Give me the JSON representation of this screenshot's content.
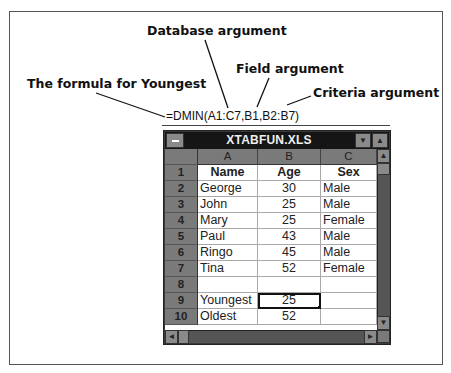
{
  "callouts": {
    "database": "Database argument",
    "field": "Field argument",
    "youngest": "The formula for Youngest",
    "criteria": "Criteria argument"
  },
  "formula": "=DMIN(A1:C7,B1,B2:B7)",
  "window": {
    "title": "XTABFUN.XLS",
    "system_menu_icon": "minus-icon",
    "minimize_icon": "down-triangle-icon",
    "maximize_icon": "up-triangle-icon"
  },
  "columns": [
    "A",
    "B",
    "C"
  ],
  "rows": [
    {
      "num": "1",
      "a": "Name",
      "b": "Age",
      "c": "Sex",
      "header": true
    },
    {
      "num": "2",
      "a": "George",
      "b": "30",
      "c": "Male"
    },
    {
      "num": "3",
      "a": "John",
      "b": "25",
      "c": "Male"
    },
    {
      "num": "4",
      "a": "Mary",
      "b": "25",
      "c": "Female"
    },
    {
      "num": "5",
      "a": "Paul",
      "b": "43",
      "c": "Male"
    },
    {
      "num": "6",
      "a": "Ringo",
      "b": "45",
      "c": "Male"
    },
    {
      "num": "7",
      "a": "Tina",
      "b": "52",
      "c": "Female"
    },
    {
      "num": "8",
      "a": "",
      "b": "",
      "c": ""
    },
    {
      "num": "9",
      "a": "Youngest",
      "b": "25",
      "c": "",
      "selected_b": true
    },
    {
      "num": "10",
      "a": "Oldest",
      "b": "52",
      "c": ""
    }
  ],
  "scrollbars": {
    "up": "▲",
    "down": "▼",
    "left": "◄",
    "right": "►"
  }
}
